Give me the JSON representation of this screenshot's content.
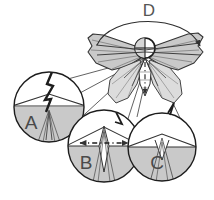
{
  "figure": {
    "kind": "insect-morphology-diagram",
    "background_color": "#ffffff",
    "outline_color": "#333333",
    "fill_gray": "#c9c9c9",
    "fill_gray_light": "#dcdcdc",
    "fill_white": "#ffffff",
    "label_color": "#4a4a4a"
  },
  "annotations": {
    "d_label": "D",
    "d_role": "wing-stroke-arc",
    "a_label": "A",
    "a_role": "forewing-margin-detail",
    "b_label": "B",
    "b_role": "thorax-span-detail",
    "c_label": "C",
    "c_role": "abdomen-tip-detail"
  },
  "callouts": [
    {
      "id": "A",
      "label": "A",
      "center_x": 49,
      "center_y": 107,
      "radius": 35,
      "label_x": 31,
      "label_y": 129
    },
    {
      "id": "B",
      "label": "B",
      "center_x": 104,
      "center_y": 146,
      "radius": 36,
      "label_x": 86,
      "label_y": 169
    },
    {
      "id": "C",
      "label": "C",
      "center_x": 162,
      "center_y": 147,
      "radius": 34,
      "label_x": 157,
      "label_y": 169
    }
  ],
  "arc_annotation": {
    "label": "D",
    "label_x": 149,
    "label_y": 16,
    "start_x": 97,
    "start_y": 45,
    "end_x": 200,
    "end_y": 46,
    "apex_y": 19
  },
  "body": {
    "head_center_x": 145,
    "head_center_y": 48,
    "head_radius": 10,
    "thorax_apex_x": 145,
    "thorax_apex_y": 58,
    "abdomen_tip_y": 96
  }
}
